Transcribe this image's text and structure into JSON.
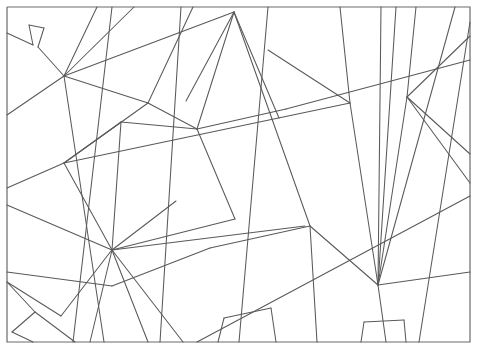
{
  "figure": {
    "kind": "line-art",
    "width": 477,
    "height": 351,
    "background_color": "#ffffff",
    "stroke_color": "#595959",
    "frame_color": "#6a6a6a",
    "stroke_width": 1.05,
    "frame": {
      "name": "outer-rectangle",
      "x": 7,
      "y": 7,
      "width": 463,
      "height": 335,
      "points": "7,7 470,7 470,342 7,342 7,7"
    },
    "segments": [
      {
        "name": "seg-01-topleft-zigzag-a",
        "points": "7,33 33,45"
      },
      {
        "name": "seg-02-topleft-zigzag-b",
        "points": "33,45 29,25"
      },
      {
        "name": "seg-03-topleft-zigzag-c",
        "points": "29,25 44,28"
      },
      {
        "name": "seg-04-topleft-zigzag-d",
        "points": "44,28 38,47"
      },
      {
        "name": "seg-05-topleft-zigzag-e",
        "points": "38,47 64,76"
      },
      {
        "name": "seg-06-long-diagonal-left",
        "points": "64,76 134,7"
      },
      {
        "name": "seg-07-steep-left-down",
        "points": "64,76 104,342"
      },
      {
        "name": "seg-08-hub-left-up",
        "points": "64,76 97,7"
      },
      {
        "name": "seg-09-hub-left-right",
        "points": "64,76 148,103"
      },
      {
        "name": "seg-10-ridge-to-apex",
        "points": "148,103 193,7"
      },
      {
        "name": "seg-11-apex-down",
        "points": "148,103 197,129"
      },
      {
        "name": "seg-12-hub-mid-chain",
        "points": "7,188 64,163"
      },
      {
        "name": "seg-13-hub-mid-chain-b",
        "points": "64,163 148,103"
      },
      {
        "name": "seg-14-left-col-down",
        "points": "64,163 112,250"
      },
      {
        "name": "seg-15-left-col-cont",
        "points": "112,250 148,342"
      },
      {
        "name": "seg-16-midfan-up",
        "points": "112,250 121,122"
      },
      {
        "name": "seg-17-midfan-upright",
        "points": "121,122 197,129"
      },
      {
        "name": "seg-18-midfan-ray-a",
        "points": "112,250 176,201"
      },
      {
        "name": "seg-19-midfan-ray-b",
        "points": "112,250 235,219"
      },
      {
        "name": "seg-20-midfan-ray-c",
        "points": "112,250 305,226"
      },
      {
        "name": "seg-21-midfan-ray-d",
        "points": "112,250 90,342"
      },
      {
        "name": "seg-22-lower-left-zig-a",
        "points": "7,282 35,312"
      },
      {
        "name": "seg-23-lower-left-zig-b",
        "points": "35,312 12,332"
      },
      {
        "name": "seg-24-lower-left-zig-c",
        "points": "12,332 33,342"
      },
      {
        "name": "seg-25-lower-left-zig-d",
        "points": "35,312 75,342"
      },
      {
        "name": "seg-26-lower-left-peak",
        "points": "7,282 61,316"
      },
      {
        "name": "seg-27-lower-left-peak-b",
        "points": "61,316 111,251"
      },
      {
        "name": "seg-28-long-left-diag",
        "points": "7,205 112,250"
      },
      {
        "name": "seg-29-long-left-diag-b",
        "points": "112,250 183,342"
      },
      {
        "name": "seg-30-hub-to-apex-long",
        "points": "64,76 234,12"
      },
      {
        "name": "seg-31-apex-fan-a",
        "points": "234,12 197,129"
      },
      {
        "name": "seg-32-apex-fan-b",
        "points": "234,12 310,226"
      },
      {
        "name": "seg-33-apex-fan-c",
        "points": "234,12 279,118"
      },
      {
        "name": "seg-34-left-vert-1",
        "points": "112,7 73,342"
      },
      {
        "name": "seg-35-col-vert-2",
        "points": "181,7 160,342"
      },
      {
        "name": "seg-36-col-vert-3",
        "points": "268,7 239,342"
      },
      {
        "name": "seg-37-col-vert-4",
        "points": "340,7 350,103"
      },
      {
        "name": "seg-38-col-vert-4b",
        "points": "350,103 378,285"
      },
      {
        "name": "seg-39-col-vert-5",
        "points": "416,7 407,97"
      },
      {
        "name": "seg-40-col-vert-5b",
        "points": "407,97 378,285"
      },
      {
        "name": "seg-41-col-vert-6",
        "points": "470,22 419,342"
      },
      {
        "name": "seg-42-band-upper-right",
        "points": "197,129 286,109"
      },
      {
        "name": "seg-43-band-upper-right-b",
        "points": "286,109 470,60"
      },
      {
        "name": "seg-44-band-to-350",
        "points": "268,50 350,103"
      },
      {
        "name": "seg-45-band-horizontal-mid",
        "points": "64,163 350,103"
      },
      {
        "name": "seg-46-right-diag-up",
        "points": "407,97 470,36"
      },
      {
        "name": "seg-47-right-triangle-a",
        "points": "407,97 470,154"
      },
      {
        "name": "seg-48-right-band-lower",
        "points": "407,97 470,183"
      },
      {
        "name": "seg-49-right-fan-a",
        "points": "378,285 381,7"
      },
      {
        "name": "seg-50-right-fan-b",
        "points": "378,285 396,7"
      },
      {
        "name": "seg-51-right-fan-c",
        "points": "378,285 455,7"
      },
      {
        "name": "seg-52-right-fan-down",
        "points": "378,285 386,342"
      },
      {
        "name": "seg-53-right-band-to-edge",
        "points": "378,285 470,272"
      },
      {
        "name": "seg-54-mid-to-right-band",
        "points": "310,226 378,285"
      },
      {
        "name": "seg-55-mid-down",
        "points": "310,226 317,342"
      },
      {
        "name": "seg-56-mid-to-left-band",
        "points": "310,226 210,248"
      },
      {
        "name": "seg-57-mid-band-left",
        "points": "210,248 112,286"
      },
      {
        "name": "seg-58-lower-long-diag",
        "points": "112,286 7,272"
      },
      {
        "name": "seg-59-lower-right-long",
        "points": "470,196 197,342"
      },
      {
        "name": "seg-60-apex-low-left",
        "points": "197,129 235,219"
      },
      {
        "name": "seg-61-rect-bl",
        "points": "218,342 224,318"
      },
      {
        "name": "seg-62-rect-bl-b",
        "points": "224,318 271,308"
      },
      {
        "name": "seg-63-rect-bl-c",
        "points": "271,308 276,342"
      },
      {
        "name": "seg-64-rect-br",
        "points": "361,342 364,322"
      },
      {
        "name": "seg-65-rect-br-b",
        "points": "364,322 404,320"
      },
      {
        "name": "seg-66-rect-br-c",
        "points": "404,320 406,342"
      },
      {
        "name": "seg-67-edge-shortleft",
        "points": "7,115 64,76"
      },
      {
        "name": "seg-68-upper-left-fan",
        "points": "121,122 64,163"
      },
      {
        "name": "seg-69-apex-fan-left",
        "points": "234,12 186,101"
      }
    ]
  }
}
